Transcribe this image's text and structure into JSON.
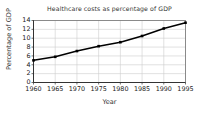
{
  "chart_data": {
    "type": "line",
    "title": "Healthcare costs as percentage of GDP",
    "xlabel": "Year",
    "ylabel": "Percentage of GDP",
    "x": [
      1960,
      1965,
      1970,
      1975,
      1980,
      1985,
      1990,
      1995
    ],
    "values": [
      5.0,
      5.8,
      7.1,
      8.2,
      9.1,
      10.5,
      12.2,
      13.5
    ],
    "xtick_labels": [
      "1960",
      "1965",
      "1970",
      "1975",
      "1980",
      "1985",
      "1990",
      "1995"
    ],
    "ytick_labels": [
      "0",
      "2",
      "4",
      "6",
      "8",
      "10",
      "12",
      "14"
    ],
    "yticks": [
      0,
      2,
      4,
      6,
      8,
      10,
      12,
      14
    ],
    "xlim": [
      1960,
      1995
    ],
    "ylim": [
      0,
      14
    ],
    "grid": true,
    "legend": false,
    "marker": "square",
    "line_color": "#000000",
    "marker_color": "#000000",
    "grid_color": "#cccccc",
    "axis_color": "#666666",
    "background_color": "#ffffff"
  }
}
